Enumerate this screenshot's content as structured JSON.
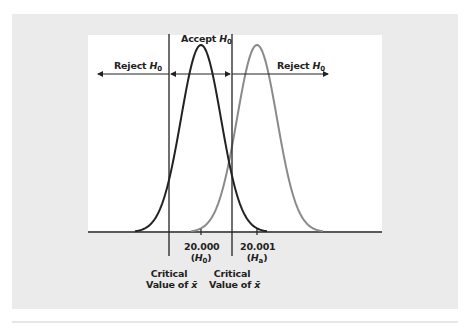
{
  "chart_data": {
    "type": "line",
    "title": "",
    "series": [
      {
        "name": "H0 distribution",
        "mean": 20.0,
        "color": "#222222"
      },
      {
        "name": "Ha distribution",
        "mean": 20.001,
        "color": "#8a8a8a"
      }
    ],
    "x_ticks": [
      {
        "value": "20.000",
        "sublabel": "H0"
      },
      {
        "value": "20.001",
        "sublabel": "Ha"
      }
    ],
    "critical_lines": [
      {
        "label": "Critical Value of x̄",
        "position": "left"
      },
      {
        "label": "Critical Value of x̄",
        "position": "right"
      }
    ],
    "regions": [
      {
        "label": "Reject H0",
        "side": "left"
      },
      {
        "label": "Accept H0",
        "side": "middle"
      },
      {
        "label": "Reject H0",
        "side": "right"
      }
    ],
    "grid": false
  },
  "labels": {
    "reject_left": "Reject",
    "reject_right": "Reject",
    "accept": "Accept",
    "h": "H",
    "sub0": "0",
    "suba": "a",
    "tick1": "20.000",
    "tick2": "20.001",
    "critical": "Critical",
    "value_of": "Value of",
    "xbar": "x̄"
  },
  "colors": {
    "panel": "#ebebeb",
    "plot": "#ffffff",
    "h0_curve": "#222222",
    "ha_curve": "#8a8a8a",
    "axis": "#222222"
  }
}
